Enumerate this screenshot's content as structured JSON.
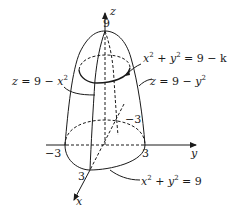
{
  "diagram": {
    "axes": {
      "z": {
        "label": "z",
        "tick_top": "9"
      },
      "y": {
        "label": "y",
        "tick_neg": "−3",
        "tick_pos": "3"
      },
      "x": {
        "label": "x",
        "tick_pos": "3",
        "tick_neg": "−3"
      }
    },
    "labels": {
      "level_curve": {
        "lhs_a": "x",
        "plus": " + ",
        "lhs_b": "y",
        "rhs": " = 9 − k",
        "exp": "2"
      },
      "surface_x": {
        "lhs": "z = 9 − ",
        "var": "x",
        "exp": "2"
      },
      "surface_y": {
        "lhs": "z = 9 − ",
        "var": "y",
        "exp": "2"
      },
      "base_curve": {
        "lhs_a": "x",
        "plus": " + ",
        "lhs_b": "y",
        "rhs": " = 9",
        "exp": "2"
      }
    },
    "colors": {
      "stroke": "#1a1a1a",
      "background": "#ffffff"
    }
  }
}
